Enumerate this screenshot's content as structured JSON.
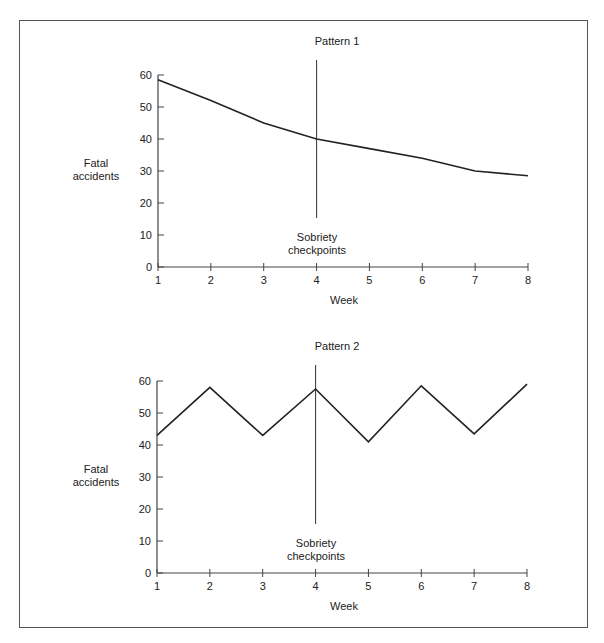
{
  "chart_data": [
    {
      "type": "line",
      "title": "Pattern 1",
      "xlabel": "Week",
      "ylabel": "Fatal accidents",
      "categories": [
        1,
        2,
        3,
        4,
        5,
        6,
        7,
        8
      ],
      "values": [
        58.5,
        52,
        45,
        40,
        37,
        34,
        30,
        28.5
      ],
      "ylim": [
        0,
        60
      ],
      "yticks": [
        0,
        10,
        20,
        30,
        40,
        50,
        60
      ],
      "xticks": [
        1,
        2,
        3,
        4,
        5,
        6,
        7,
        8
      ],
      "grid": false,
      "annotation": {
        "x": 4,
        "label_line1": "Sobriety",
        "label_line2": "checkpoints"
      }
    },
    {
      "type": "line",
      "title": "Pattern 2",
      "xlabel": "Week",
      "ylabel": "Fatal accidents",
      "categories": [
        1,
        2,
        3,
        4,
        5,
        6,
        7,
        8
      ],
      "values": [
        43,
        58,
        43,
        57.5,
        41,
        58.5,
        43.5,
        59
      ],
      "ylim": [
        0,
        60
      ],
      "yticks": [
        0,
        10,
        20,
        30,
        40,
        50,
        60
      ],
      "xticks": [
        1,
        2,
        3,
        4,
        5,
        6,
        7,
        8
      ],
      "grid": false,
      "annotation": {
        "x": 4,
        "label_line1": "Sobriety",
        "label_line2": "checkpoints"
      }
    }
  ],
  "charts": [
    {
      "title": "Pattern 1",
      "ylabel_line1": "Fatal",
      "ylabel_line2": "accidents",
      "xlabel": "Week",
      "annotation_line1": "Sobriety",
      "annotation_line2": "checkpoints"
    },
    {
      "title": "Pattern 2",
      "ylabel_line1": "Fatal",
      "ylabel_line2": "accidents",
      "xlabel": "Week",
      "annotation_line1": "Sobriety",
      "annotation_line2": "checkpoints"
    }
  ],
  "colors": {
    "line": "#222222",
    "axis": "#444444",
    "frame": "#555555"
  }
}
